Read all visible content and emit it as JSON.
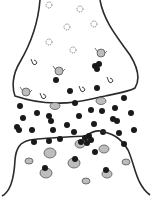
{
  "diagram": {
    "type": "synapse",
    "colors": {
      "background": "#ffffff",
      "membrane": "#2a2a2a",
      "neurotransmitter": "#1a1a1a",
      "vesicle_fill": "#bdbdbd",
      "vesicle_stroke": "#555555",
      "empty_vesicle_stroke": "#666666"
    },
    "presynaptic": {
      "outline": "M40,0 C38,25 30,45 20,62 C12,75 12,88 15,96 C30,101 45,103 55,103 C75,104 90,99 105,96 C118,93 128,92 135,88 C140,80 138,68 130,55 C118,38 104,22 100,0",
      "empty_vesicles": [
        {
          "cx": 49,
          "cy": 5,
          "r": 3
        },
        {
          "cx": 80,
          "cy": 9,
          "r": 3
        },
        {
          "cx": 67,
          "cy": 27,
          "r": 3
        },
        {
          "cx": 94,
          "cy": 24,
          "r": 3
        },
        {
          "cx": 49,
          "cy": 42,
          "r": 3
        },
        {
          "cx": 73,
          "cy": 50,
          "r": 3
        }
      ],
      "open_vesicles": [
        {
          "x": 34,
          "y": 62
        },
        {
          "x": 110,
          "y": 80
        },
        {
          "x": 82,
          "y": 89
        },
        {
          "x": 43,
          "y": 96
        }
      ],
      "docked_vesicles": [
        {
          "cx": 101,
          "cy": 53,
          "r": 4
        },
        {
          "cx": 59,
          "cy": 71,
          "r": 4
        },
        {
          "cx": 26,
          "cy": 92,
          "r": 4
        }
      ],
      "transmitters": [
        {
          "cx": 95,
          "cy": 66,
          "r": 3
        },
        {
          "cx": 99,
          "cy": 64,
          "r": 3
        },
        {
          "cx": 97,
          "cy": 69,
          "r": 3
        },
        {
          "cx": 56,
          "cy": 80,
          "r": 3
        },
        {
          "cx": 70,
          "cy": 91,
          "r": 3
        },
        {
          "cx": 97,
          "cy": 88,
          "r": 3
        }
      ]
    },
    "cleft": {
      "membrane_vesicles": [
        {
          "cx": 55,
          "cy": 106,
          "r": 4
        },
        {
          "cx": 101,
          "cy": 101,
          "r": 4
        }
      ],
      "transmitters": [
        {
          "cx": 75,
          "cy": 103,
          "r": 3
        },
        {
          "cx": 124,
          "cy": 98,
          "r": 3
        },
        {
          "cx": 20,
          "cy": 106,
          "r": 3
        },
        {
          "cx": 37,
          "cy": 113,
          "r": 3
        },
        {
          "cx": 23,
          "cy": 118,
          "r": 3
        },
        {
          "cx": 49,
          "cy": 116,
          "r": 3
        },
        {
          "cx": 51,
          "cy": 121,
          "r": 3
        },
        {
          "cx": 79,
          "cy": 116,
          "r": 3
        },
        {
          "cx": 91,
          "cy": 110,
          "r": 3
        },
        {
          "cx": 102,
          "cy": 111,
          "r": 3
        },
        {
          "cx": 115,
          "cy": 108,
          "r": 3
        },
        {
          "cx": 131,
          "cy": 113,
          "r": 3
        },
        {
          "cx": 113,
          "cy": 119,
          "r": 3
        },
        {
          "cx": 117,
          "cy": 121,
          "r": 3
        },
        {
          "cx": 94,
          "cy": 124,
          "r": 3
        },
        {
          "cx": 67,
          "cy": 125,
          "r": 3
        },
        {
          "cx": 17,
          "cy": 127,
          "r": 3
        },
        {
          "cx": 19,
          "cy": 130,
          "r": 3
        },
        {
          "cx": 32,
          "cy": 130,
          "r": 3
        },
        {
          "cx": 53,
          "cy": 130,
          "r": 3
        },
        {
          "cx": 74,
          "cy": 132,
          "r": 3
        },
        {
          "cx": 103,
          "cy": 132,
          "r": 3
        },
        {
          "cx": 119,
          "cy": 133,
          "r": 3
        },
        {
          "cx": 134,
          "cy": 130,
          "r": 3
        }
      ]
    },
    "postsynaptic": {
      "outline": "M2,196 C10,192 14,180 15,160 C16,148 20,142 30,140 C50,137 70,137 85,136 C90,133 95,130 100,131 C110,133 120,136 128,150 C135,165 136,185 150,195",
      "receptors": [
        {
          "cx": 49,
          "cy": 141,
          "r": 3
        },
        {
          "cx": 60,
          "cy": 139,
          "r": 3
        },
        {
          "cx": 85,
          "cy": 138,
          "r": 3
        },
        {
          "cx": 89,
          "cy": 136,
          "r": 3
        },
        {
          "cx": 91,
          "cy": 140,
          "r": 3
        },
        {
          "cx": 81,
          "cy": 142,
          "r": 3
        },
        {
          "cx": 87,
          "cy": 143,
          "r": 3
        },
        {
          "cx": 34,
          "cy": 142,
          "r": 3
        },
        {
          "cx": 124,
          "cy": 144,
          "r": 3
        },
        {
          "cx": 95,
          "cy": 152,
          "r": 3
        }
      ],
      "vesicles": [
        {
          "cx": 50,
          "cy": 153,
          "rx": 6,
          "ry": 5
        },
        {
          "cx": 80,
          "cy": 144,
          "rx": 5,
          "ry": 4
        },
        {
          "cx": 104,
          "cy": 149,
          "rx": 5,
          "ry": 4
        },
        {
          "cx": 29,
          "cy": 161,
          "rx": 4,
          "ry": 3
        },
        {
          "cx": 74,
          "cy": 163,
          "rx": 6,
          "ry": 5
        },
        {
          "cx": 126,
          "cy": 162,
          "rx": 4,
          "ry": 3
        },
        {
          "cx": 46,
          "cy": 173,
          "rx": 6,
          "ry": 5
        },
        {
          "cx": 107,
          "cy": 174,
          "rx": 5,
          "ry": 4
        },
        {
          "cx": 86,
          "cy": 181,
          "rx": 4,
          "ry": 3
        }
      ],
      "bound_transmitters": [
        {
          "cx": 75,
          "cy": 159,
          "r": 3
        },
        {
          "cx": 45,
          "cy": 168,
          "r": 3
        },
        {
          "cx": 106,
          "cy": 170,
          "r": 3
        }
      ]
    }
  }
}
